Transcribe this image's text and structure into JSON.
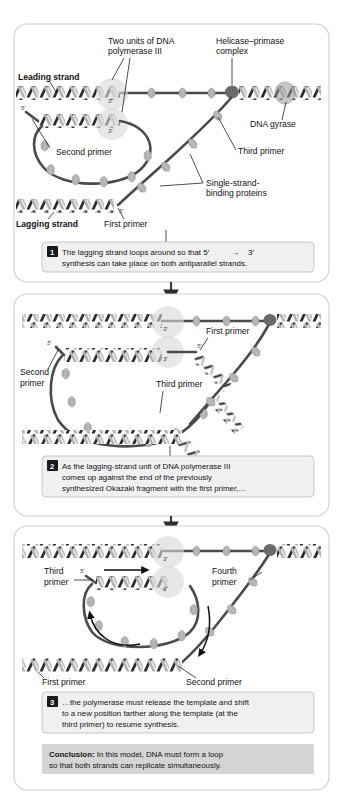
{
  "figure": {
    "panel_count": 3
  },
  "colors": {
    "panel_border": "#cfcfcf",
    "caption_bg": "#f0f0f0",
    "caption_border": "#c2c2c2",
    "conclusion_bg": "#d5d5d5",
    "template_strand": "#4a4a4a",
    "ssb_protein": "#b9b9b9",
    "polymerase": "#d9d9d9",
    "helicase": "#6a6a6a",
    "number_badge": "#1a1a1a"
  },
  "panels": [
    {
      "id": "panel-1",
      "number": "1",
      "caption_line1": "The lagging strand loops around so that 5′",
      "caption_arrow": "→",
      "caption_line1b": "3′",
      "caption_line2": "synthesis can take place on both antiparallel strands.",
      "labels": [
        {
          "name": "two-units-dna-polymerase-iii",
          "line1": "Two units of DNA",
          "line2": "polymerase III"
        },
        {
          "name": "helicase-primase-complex",
          "line1": "Helicase–primase",
          "line2": "complex"
        },
        {
          "name": "leading-strand",
          "line1": "Leading strand",
          "line2": "",
          "bold": true
        },
        {
          "name": "dna-gyrase",
          "line1": "DNA gyrase",
          "line2": ""
        },
        {
          "name": "second-primer",
          "line1": "Second primer",
          "line2": ""
        },
        {
          "name": "third-primer",
          "line1": "Third primer",
          "line2": ""
        },
        {
          "name": "single-strand-binding-proteins",
          "line1": "Single-strand-",
          "line2": "binding proteins"
        },
        {
          "name": "lagging-strand",
          "line1": "Lagging strand",
          "line2": "",
          "bold": true
        },
        {
          "name": "first-primer",
          "line1": "First primer",
          "line2": ""
        }
      ],
      "end_ticks": [
        "5′",
        "3′",
        "3′",
        "5′"
      ]
    },
    {
      "id": "panel-2",
      "number": "2",
      "caption_line1": "As the lagging-strand unit of DNA polymerase III",
      "caption_line2": "comes up against the end of the previously",
      "caption_line3": "synthesized Okazaki fragment with the first primer,…",
      "labels": [
        {
          "name": "first-primer",
          "line1": "First primer",
          "line2": ""
        },
        {
          "name": "second-primer",
          "line1": "Second",
          "line2": "primer"
        },
        {
          "name": "third-primer",
          "line1": "Third primer",
          "line2": ""
        }
      ],
      "end_ticks": [
        "3′",
        "5′",
        "3′",
        "5′"
      ]
    },
    {
      "id": "panel-3",
      "number": "3",
      "caption_line1": "…the polymerase must release the template and shift",
      "caption_line2": "to a new position farther along the template (at the",
      "caption_line3": "third primer) to resume synthesis.",
      "labels": [
        {
          "name": "third-primer",
          "line1": "Third",
          "line2": "primer"
        },
        {
          "name": "fourth-primer",
          "line1": "Fourth",
          "line2": "primer"
        },
        {
          "name": "first-primer",
          "line1": "First primer",
          "line2": ""
        },
        {
          "name": "second-primer",
          "line1": "Second primer",
          "line2": ""
        }
      ],
      "end_ticks": [
        "3′",
        "5′",
        "3′"
      ]
    }
  ],
  "conclusion": {
    "label": "Conclusion:",
    "line1": " In this model, DNA must form a loop",
    "line2": "so that both strands can replicate simultaneously."
  }
}
